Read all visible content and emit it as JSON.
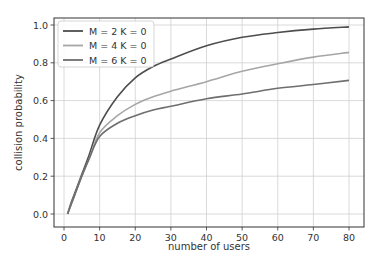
{
  "chart_data": {
    "type": "line",
    "title": "",
    "xlabel": "number of users",
    "ylabel": "collision probability",
    "xlim": [
      -3,
      84
    ],
    "ylim": [
      -0.03,
      1.04
    ],
    "xticks": [
      0,
      10,
      20,
      30,
      40,
      50,
      60,
      70,
      80
    ],
    "yticks": [
      0.0,
      0.2,
      0.4,
      0.6,
      0.8,
      1.0
    ],
    "ytick_labels": [
      "0.0",
      "0.2",
      "0.4",
      "0.6",
      "0.8",
      "1.0"
    ],
    "grid": true,
    "legend_position": "upper left",
    "x": [
      1,
      2,
      3,
      5,
      7,
      10,
      15,
      20,
      25,
      30,
      40,
      50,
      60,
      70,
      80
    ],
    "series": [
      {
        "name": "M = 2 K = 0",
        "color": "#4d4d4d",
        "values": [
          0.0,
          0.06,
          0.11,
          0.21,
          0.31,
          0.47,
          0.62,
          0.72,
          0.78,
          0.82,
          0.89,
          0.935,
          0.96,
          0.978,
          0.99
        ]
      },
      {
        "name": "M = 4 K = 0",
        "color": "#a6a6a6",
        "values": [
          0.0,
          0.05,
          0.1,
          0.2,
          0.29,
          0.43,
          0.52,
          0.58,
          0.62,
          0.65,
          0.7,
          0.755,
          0.795,
          0.83,
          0.855
        ]
      },
      {
        "name": "M = 6 K = 0",
        "color": "#6e6e6e",
        "values": [
          0.0,
          0.05,
          0.1,
          0.2,
          0.29,
          0.41,
          0.48,
          0.52,
          0.55,
          0.57,
          0.61,
          0.635,
          0.665,
          0.685,
          0.707
        ]
      }
    ]
  }
}
